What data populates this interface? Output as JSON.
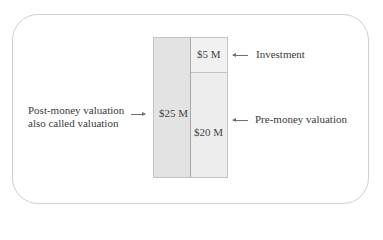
{
  "diagram": {
    "title": "",
    "bar": {
      "post_money": {
        "label": "$25 M",
        "value": 25
      },
      "investment": {
        "label": "$5 M",
        "value": 5
      },
      "pre_money": {
        "label": "$20 M",
        "value": 20
      }
    },
    "annotations": {
      "investment": "Investment",
      "pre_money": "Pre-money valuation",
      "post_money_line1": "Post-money valuation",
      "post_money_line2": "also called valuation"
    },
    "colors": {
      "frame_border": "#cfcfcf",
      "post_money_fill": "#e3e3e3",
      "investment_fill": "#f1f1f1",
      "pre_money_fill": "#ededed",
      "arrow": "#707070",
      "text": "#3a3a3a"
    }
  }
}
